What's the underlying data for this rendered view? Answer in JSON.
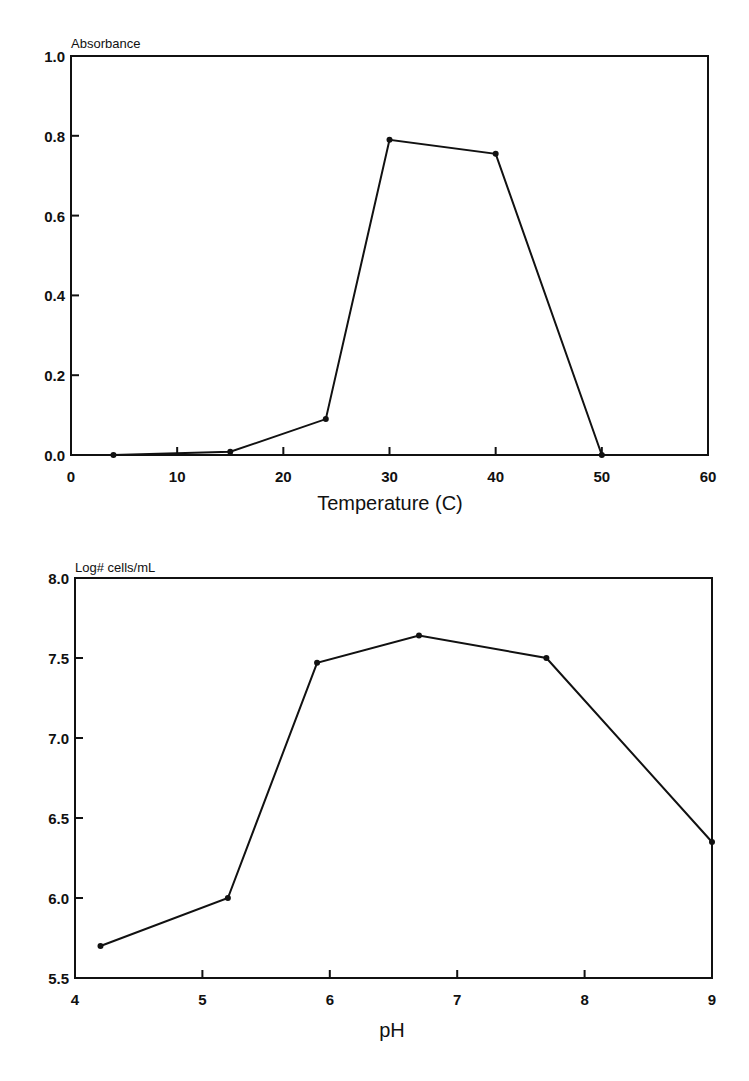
{
  "chart_data": [
    {
      "type": "line",
      "title": "",
      "xlabel": "Temperature (C)",
      "ylabel": "Absorbance",
      "xlim": [
        0,
        60
      ],
      "ylim": [
        0.0,
        1.0
      ],
      "xticks": [
        0,
        10,
        20,
        30,
        40,
        50,
        60
      ],
      "xtick_labels": [
        "0",
        "10",
        "20",
        "30",
        "40",
        "50",
        "60"
      ],
      "yticks": [
        0.0,
        0.2,
        0.4,
        0.6,
        0.8,
        1.0
      ],
      "ytick_labels": [
        "0.0",
        "0.2",
        "0.4",
        "0.6",
        "0.8",
        "1.0"
      ],
      "grid": false,
      "legend": null,
      "series": [
        {
          "name": "Absorbance",
          "x": [
            4,
            15,
            24,
            30,
            40,
            50
          ],
          "values": [
            0.0,
            0.008,
            0.09,
            0.79,
            0.755,
            0.0
          ]
        }
      ]
    },
    {
      "type": "line",
      "title": "",
      "xlabel": "pH",
      "ylabel": "Log# cells/mL",
      "xlim": [
        4,
        9
      ],
      "ylim": [
        5.5,
        8.0
      ],
      "xticks": [
        4,
        5,
        6,
        7,
        8,
        9
      ],
      "xtick_labels": [
        "4",
        "5",
        "6",
        "7",
        "8",
        "9"
      ],
      "yticks": [
        5.5,
        6.0,
        6.5,
        7.0,
        7.5,
        8.0
      ],
      "ytick_labels": [
        "5.5",
        "6.0",
        "6.5",
        "7.0",
        "7.5",
        "8.0"
      ],
      "grid": false,
      "legend": null,
      "series": [
        {
          "name": "Log# cells/mL",
          "x": [
            4.2,
            5.2,
            5.9,
            6.7,
            7.7,
            9.0
          ],
          "values": [
            5.7,
            6.0,
            7.47,
            7.64,
            7.5,
            6.35
          ]
        }
      ]
    }
  ],
  "charts": {
    "top": {
      "ylabel": "Absorbance",
      "xlabel": "Temperature (C)"
    },
    "bottom": {
      "ylabel": "Log# cells/mL",
      "xlabel": "pH"
    }
  },
  "colors": {
    "ink": "#111111",
    "background": "#ffffff"
  }
}
